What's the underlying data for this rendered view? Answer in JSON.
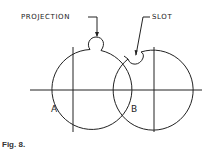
{
  "figure": {
    "caption": "Fig. 8.",
    "labels": {
      "projection": "PROJECTION",
      "slot": "SLOT",
      "circle_a": "A",
      "circle_b": "B"
    },
    "stroke_color": "#222222"
  }
}
